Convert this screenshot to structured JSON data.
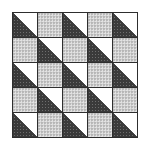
{
  "pattern": {
    "rows": 5,
    "cols": 5,
    "colors": {
      "border": "#2e2e2e",
      "light_fabric": "#cfcfcf",
      "dark_fabric": "#3a3a3a",
      "white_fabric": "#ffffff"
    },
    "cells": [
      [
        "tri",
        "gray",
        "tri",
        "gray",
        "tri"
      ],
      [
        "gray",
        "tri",
        "gray",
        "tri",
        "gray"
      ],
      [
        "tri",
        "gray",
        "tri",
        "gray",
        "tri"
      ],
      [
        "gray",
        "tri",
        "gray",
        "tri",
        "gray"
      ],
      [
        "tri",
        "gray",
        "tri",
        "gray",
        "tri"
      ]
    ],
    "triangle": {
      "top_right": "white",
      "bottom_left": "dark"
    }
  }
}
